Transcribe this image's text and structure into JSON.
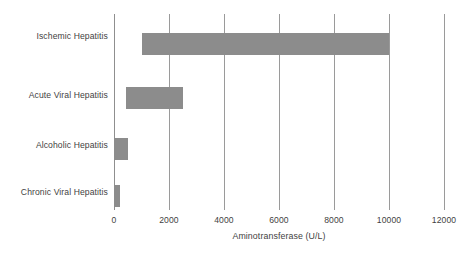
{
  "chart_data": {
    "type": "bar",
    "orientation": "horizontal",
    "title": "",
    "xlabel": "Aminotransferase (U/L)",
    "ylabel": "",
    "categories": [
      "Ischemic Hepatitis",
      "Acute Viral Hepatitis",
      "Alcoholic Hepatitis",
      "Chronic Viral Hepatitis"
    ],
    "bars": [
      {
        "category": "Ischemic Hepatitis",
        "start": 1000,
        "end": 10000
      },
      {
        "category": "Acute Viral Hepatitis",
        "start": 450,
        "end": 2500
      },
      {
        "category": "Alcoholic Hepatitis",
        "start": 0,
        "end": 500
      },
      {
        "category": "Chronic Viral Hepatitis",
        "start": 0,
        "end": 200
      }
    ],
    "values": [
      9000,
      2050,
      500,
      200
    ],
    "xlim": [
      0,
      12000
    ],
    "xticks": [
      0,
      2000,
      4000,
      6000,
      8000,
      10000,
      12000
    ],
    "xtick_labels": [
      "0",
      "2000",
      "4000",
      "6000",
      "8000",
      "10000",
      "12000"
    ],
    "grid": "vertical",
    "legend": "none",
    "colors": {
      "bar": "#8c8c8c",
      "gridline": "#9a9a9a",
      "text": "#3f3f3f",
      "background": "#ffffff"
    }
  }
}
